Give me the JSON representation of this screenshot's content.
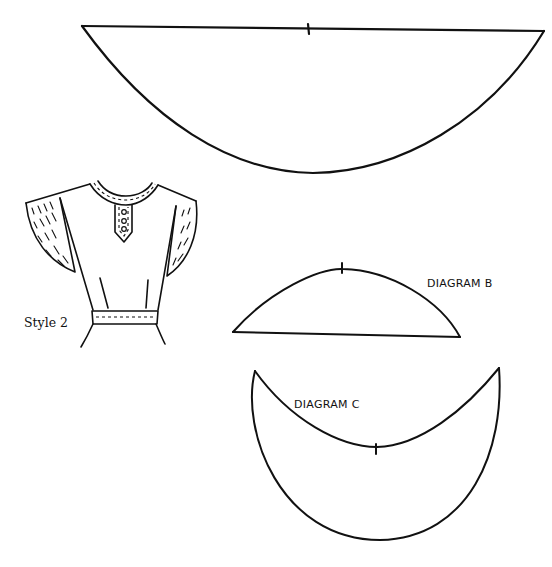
{
  "figure": {
    "style_label": "Style 2",
    "diagrams": [
      {
        "id": "A",
        "label": "",
        "shape": "half-circle-collar"
      },
      {
        "id": "B",
        "label": "DIAGRAM B",
        "shape": "segment"
      },
      {
        "id": "C",
        "label": "DIAGRAM C",
        "shape": "crescent"
      }
    ],
    "colors": {
      "ink": "#111111",
      "paper": "#ffffff"
    }
  }
}
